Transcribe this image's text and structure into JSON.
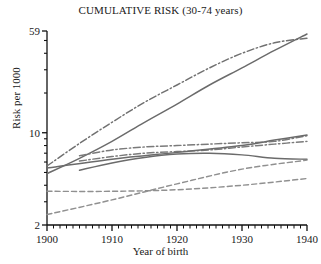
{
  "chart_data": {
    "type": "line",
    "title": "CUMULATIVE RISK (30-74 years)",
    "xlabel": "Year of birth",
    "ylabel": "Risk per 1000",
    "yscale": "log",
    "ylim": [
      2,
      59
    ],
    "xlim": [
      1900,
      1940
    ],
    "grid": false,
    "legend": "none",
    "ytick_labels": [
      "59",
      "10",
      "2"
    ],
    "ytick_values": [
      59,
      10,
      2
    ],
    "xtick_labels": [
      "1900",
      "1910",
      "1920",
      "1930",
      "1940"
    ],
    "xtick_values": [
      1900,
      1910,
      1920,
      1930,
      1940
    ],
    "x_minor_tick_step": 1,
    "series": [
      {
        "name": "series-1-dashdot-steep",
        "style": "dashdot",
        "color": "#707070",
        "x": [
          1900,
          1905,
          1910,
          1915,
          1920,
          1925,
          1930,
          1935,
          1940
        ],
        "values": [
          5.6,
          8.3,
          12.0,
          17.0,
          23.0,
          31.0,
          40.0,
          48.0,
          52.0
        ]
      },
      {
        "name": "series-2-solid-steep",
        "style": "solid",
        "color": "#6b6b6b",
        "x": [
          1900,
          1905,
          1910,
          1915,
          1920,
          1925,
          1930,
          1935,
          1940
        ],
        "values": [
          4.9,
          6.4,
          8.6,
          12.0,
          16.5,
          23.0,
          31.0,
          42.0,
          56.0
        ]
      },
      {
        "name": "series-3-dashdot-upper-mid",
        "style": "dashdot",
        "color": "#7a7a7a",
        "x": [
          1905,
          1910,
          1915,
          1920,
          1925,
          1930,
          1935,
          1940
        ],
        "values": [
          6.7,
          7.4,
          7.8,
          8.0,
          8.2,
          8.4,
          8.6,
          9.5
        ]
      },
      {
        "name": "series-4-dashdot-lower-mid",
        "style": "dashdot",
        "color": "#7a7a7a",
        "x": [
          1905,
          1910,
          1915,
          1920,
          1925,
          1930,
          1935,
          1940
        ],
        "values": [
          6.1,
          6.6,
          7.0,
          7.2,
          7.4,
          7.8,
          8.2,
          8.6
        ]
      },
      {
        "name": "series-5-solid-mid-rising",
        "style": "solid",
        "color": "#6b6b6b",
        "x": [
          1900,
          1910,
          1920,
          1930,
          1935,
          1940
        ],
        "values": [
          5.4,
          6.3,
          7.1,
          8.0,
          8.8,
          9.6
        ]
      },
      {
        "name": "series-6-solid-mid-arch",
        "style": "solid",
        "color": "#6b6b6b",
        "x": [
          1905,
          1910,
          1915,
          1920,
          1925,
          1930,
          1935,
          1940
        ],
        "values": [
          5.2,
          5.9,
          6.5,
          6.9,
          7.0,
          6.8,
          6.4,
          6.3
        ]
      },
      {
        "name": "series-7-dashed-flat",
        "style": "dashed",
        "color": "#909090",
        "x": [
          1900,
          1910,
          1920,
          1930,
          1940
        ],
        "values": [
          3.6,
          3.6,
          3.7,
          4.0,
          4.5
        ]
      },
      {
        "name": "series-8-dashed-rising",
        "style": "dashed",
        "color": "#909090",
        "x": [
          1900,
          1910,
          1920,
          1930,
          1940
        ],
        "values": [
          2.4,
          3.1,
          4.1,
          5.3,
          6.2
        ]
      }
    ]
  },
  "axes": {
    "title": "CUMULATIVE RISK (30-74 years)",
    "y_axis_label": "Risk per 1000",
    "x_axis_label": "Year of birth"
  }
}
